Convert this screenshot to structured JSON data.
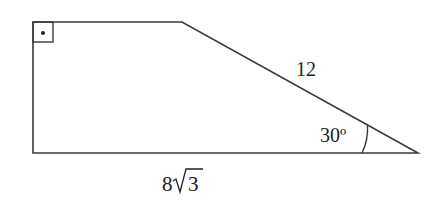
{
  "diagram": {
    "type": "right trapezoid",
    "labels": {
      "slant_side": "12",
      "angle": "30º",
      "bottom_base_coef": "8",
      "bottom_base_radicand": "3"
    },
    "right_angle_marker": "right-angle-with-dot",
    "colors": {
      "stroke": "#3a3a3a",
      "text": "#222222"
    }
  }
}
